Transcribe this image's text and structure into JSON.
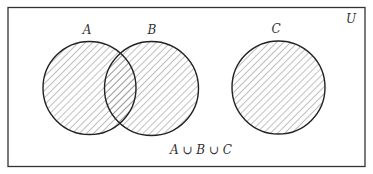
{
  "diagram": {
    "type": "venn",
    "universe_label": "U",
    "sets": [
      {
        "label": "A",
        "cx": 89.5,
        "cy": 88,
        "r": 46.5,
        "shaded": true
      },
      {
        "label": "B",
        "cx": 151.5,
        "cy": 88.5,
        "r": 47,
        "shaded": true
      },
      {
        "label": "C",
        "cx": 278.5,
        "cy": 87.5,
        "r": 46.5,
        "shaded": true
      }
    ],
    "caption": "A ∪ B ∪ C",
    "colors": {
      "border": "#333333",
      "hatch": "#888888",
      "background": "#ffffff"
    }
  }
}
